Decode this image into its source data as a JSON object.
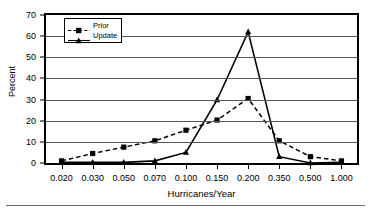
{
  "chart_data": {
    "type": "line",
    "title": "",
    "xlabel": "Hurricanes/Year",
    "ylabel": "Percent",
    "categories": [
      "0.020",
      "0.030",
      "0.050",
      "0.070",
      "0.100",
      "0.150",
      "0.200",
      "0.350",
      "0.500",
      "1.000"
    ],
    "ylim": [
      0,
      70
    ],
    "yticks": [
      0,
      10,
      20,
      30,
      40,
      50,
      60,
      70
    ],
    "grid": "horizontal",
    "legend_position": "upper-left-inside",
    "series": [
      {
        "name": "Prior",
        "marker": "square",
        "linestyle": "dashed",
        "color": "#000000",
        "values": [
          1.0,
          4.5,
          7.5,
          10.5,
          15.5,
          20.3,
          30.5,
          10.5,
          3.0,
          1.0
        ]
      },
      {
        "name": "Update",
        "marker": "triangle",
        "linestyle": "solid",
        "color": "#000000",
        "values": [
          0.3,
          0.3,
          0.3,
          1.0,
          5.0,
          29.8,
          62.0,
          3.0,
          0.0,
          0.3
        ]
      }
    ]
  },
  "axis": {
    "y_title": "Percent",
    "x_title": "Hurricanes/Year"
  },
  "legend": {
    "entries": [
      {
        "label": "Prior"
      },
      {
        "label": "Update"
      }
    ]
  }
}
